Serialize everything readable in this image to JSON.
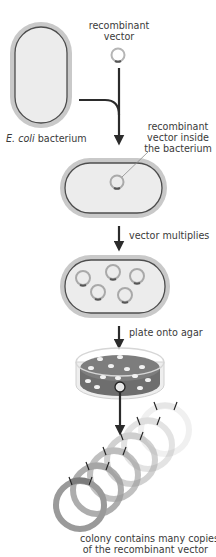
{
  "labels": {
    "recombinant_vector_line1": "recombinant",
    "recombinant_vector_line2": "vector",
    "ecoli_italic": "E. coli",
    "ecoli_rest": " bacterium",
    "inside_line1": "recombinant",
    "inside_line2": "vector inside",
    "inside_line3": "the bacterium",
    "step_multiplies": "vector multiplies",
    "step_plate": "plate onto agar",
    "colony_line1": "colony contains many copies",
    "colony_line2": "of the recombinant vector"
  },
  "colors": {
    "capsule_outer": "#c9c9c9",
    "capsule_border": "#4d4d4d",
    "capsule_fill": "#ececec",
    "arrow": "#2b2b2b",
    "agar": "#7d7d7d",
    "colony": "#f2f2f2"
  }
}
